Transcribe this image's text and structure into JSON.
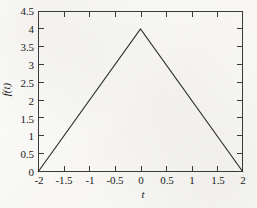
{
  "chart_data": {
    "type": "line",
    "title": "",
    "xlabel": "t",
    "ylabel": "f(t)",
    "xlim": [
      -2,
      2
    ],
    "ylim": [
      0,
      4.5
    ],
    "grid": false,
    "legend": false,
    "legend_position": "none",
    "x_ticks": [
      -2,
      -1.5,
      -1,
      -0.5,
      0,
      0.5,
      1,
      1.5,
      2
    ],
    "x_tick_labels": [
      "-2",
      "-1.5",
      "-1",
      "-0.5",
      "0",
      "0.5",
      "1",
      "1.5",
      "2"
    ],
    "y_ticks": [
      0,
      0.5,
      1,
      1.5,
      2,
      2.5,
      3,
      3.5,
      4,
      4.5
    ],
    "y_tick_labels": [
      "0",
      "0.5",
      "1",
      "1.5",
      "2",
      "2.5",
      "3",
      "3.5",
      "4",
      "4.5"
    ],
    "series": [
      {
        "name": "f(t)",
        "color": "#2b2b2b",
        "x": [
          -2,
          0,
          2
        ],
        "values": [
          0,
          4,
          0
        ]
      }
    ],
    "annotations": []
  },
  "style": {
    "line_color": "#2b2b2b",
    "axis_color": "#3a3a3a",
    "background": "#fbfbfa",
    "text_color": "#1a1a1a"
  }
}
